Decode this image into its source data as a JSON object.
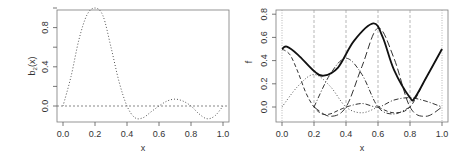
{
  "chart_data": [
    {
      "type": "line",
      "title": "",
      "xlabel": "x",
      "ylabel": "b_2(x)",
      "xlim": [
        0.0,
        1.0
      ],
      "ylim": [
        -0.15,
        1.05
      ],
      "xticks": [
        "0.0",
        "0.2",
        "0.4",
        "0.6",
        "0.8",
        "1.0"
      ],
      "yticks": [
        "0.0",
        "0.4",
        "0.8"
      ],
      "grid": false,
      "reference_line": {
        "y": 0.0,
        "style": "dashed"
      },
      "series": [
        {
          "name": "b_2(x)",
          "style": "dotted",
          "x": [
            0.0,
            0.05,
            0.1,
            0.15,
            0.2,
            0.25,
            0.3,
            0.35,
            0.4,
            0.45,
            0.5,
            0.55,
            0.6,
            0.65,
            0.7,
            0.75,
            0.8,
            0.85,
            0.9,
            0.95,
            1.0
          ],
          "y": [
            0.0,
            0.3,
            0.68,
            0.93,
            1.0,
            0.92,
            0.6,
            0.25,
            0.0,
            -0.12,
            -0.12,
            -0.06,
            0.0,
            0.05,
            0.07,
            0.05,
            0.0,
            -0.08,
            -0.13,
            -0.1,
            0.0
          ]
        }
      ]
    },
    {
      "type": "line",
      "title": "",
      "xlabel": "x",
      "ylabel": "f",
      "xlim": [
        0.0,
        1.0
      ],
      "ylim": [
        -0.12,
        0.82
      ],
      "xticks": [
        "0.0",
        "0.2",
        "0.4",
        "0.6",
        "0.8",
        "1.0"
      ],
      "yticks": [
        "0.0",
        "0.2",
        "0.4",
        "0.6",
        "0.8"
      ],
      "grid": false,
      "vertical_reference_lines": [
        0.0,
        0.2,
        0.4,
        0.6,
        0.8,
        1.0
      ],
      "series": [
        {
          "name": "f (sum)",
          "style": "solid-bold",
          "x": [
            0.0,
            0.03,
            0.1,
            0.2,
            0.26,
            0.35,
            0.45,
            0.57,
            0.63,
            0.7,
            0.8,
            0.83,
            0.9,
            1.0
          ],
          "y": [
            0.5,
            0.52,
            0.45,
            0.31,
            0.27,
            0.34,
            0.57,
            0.72,
            0.6,
            0.32,
            0.08,
            0.08,
            0.25,
            0.5
          ]
        },
        {
          "name": "basis at 0.0",
          "style": "dashed",
          "x": [
            0.0,
            0.05,
            0.1,
            0.15,
            0.2,
            0.25,
            0.3,
            0.35,
            0.4
          ],
          "y": [
            0.5,
            0.45,
            0.3,
            0.12,
            0.0,
            -0.06,
            -0.06,
            -0.03,
            0.0
          ]
        },
        {
          "name": "basis at 0.2",
          "style": "dotted",
          "x": [
            0.0,
            0.1,
            0.2,
            0.3,
            0.4,
            0.5,
            0.6
          ],
          "y": [
            0.0,
            0.18,
            0.28,
            0.18,
            0.0,
            -0.05,
            0.0
          ]
        },
        {
          "name": "basis at 0.4",
          "style": "dash-dot",
          "x": [
            0.2,
            0.3,
            0.4,
            0.5,
            0.6,
            0.7,
            0.8
          ],
          "y": [
            0.0,
            0.28,
            0.42,
            0.28,
            0.0,
            -0.06,
            0.0
          ]
        },
        {
          "name": "basis at 0.6",
          "style": "long-dash",
          "x": [
            0.2,
            0.3,
            0.4,
            0.5,
            0.6,
            0.7,
            0.8,
            0.9,
            1.0
          ],
          "y": [
            0.0,
            -0.08,
            0.0,
            0.35,
            0.68,
            0.42,
            0.0,
            -0.08,
            0.0
          ]
        },
        {
          "name": "basis at 0.8",
          "style": "dash-dot",
          "x": [
            0.4,
            0.5,
            0.6,
            0.7,
            0.8,
            0.9,
            1.0
          ],
          "y": [
            0.0,
            0.03,
            0.0,
            0.06,
            0.08,
            0.05,
            0.0
          ]
        },
        {
          "name": "basis at 1.0",
          "style": "dashed",
          "x": [
            0.6,
            0.7,
            0.8,
            0.9,
            1.0
          ],
          "y": [
            0.0,
            -0.05,
            0.0,
            0.25,
            0.5
          ]
        }
      ]
    }
  ],
  "panels": {
    "left": {
      "ylabel": "b",
      "ylabel_sub": "2",
      "ylabel_rest": "(x)",
      "xlabel": "x",
      "xticks": [
        "0.0",
        "0.2",
        "0.4",
        "0.6",
        "0.8",
        "1.0"
      ],
      "yticks": [
        "0.0",
        "0.4",
        "0.8"
      ]
    },
    "right": {
      "ylabel": "f",
      "xlabel": "x",
      "xticks": [
        "0.0",
        "0.2",
        "0.4",
        "0.6",
        "0.8",
        "1.0"
      ],
      "yticks": [
        "0.0",
        "0.2",
        "0.4",
        "0.6",
        "0.8"
      ]
    }
  }
}
